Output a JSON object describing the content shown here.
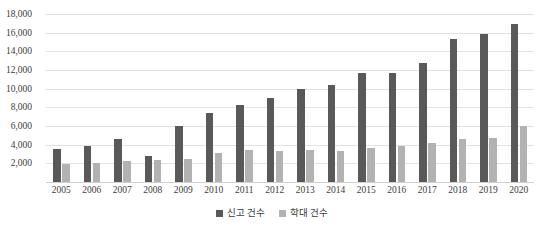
{
  "chart_data": {
    "type": "bar",
    "title": "",
    "xlabel": "",
    "ylabel": "",
    "ylim": [
      0,
      18000
    ],
    "ytick_step": 2000,
    "grid": true,
    "legend_position": "bottom",
    "categories": [
      "2005",
      "2006",
      "2007",
      "2008",
      "2009",
      "2010",
      "2011",
      "2012",
      "2013",
      "2014",
      "2015",
      "2016",
      "2017",
      "2018",
      "2019",
      "2020"
    ],
    "ytick_labels": [
      "18,000",
      "16,000",
      "14,000",
      "12,000",
      "10,000",
      "8,000",
      "6,000",
      "4,000",
      "2,000"
    ],
    "ytick_values": [
      18000,
      16000,
      14000,
      12000,
      10000,
      8000,
      6000,
      4000,
      2000
    ],
    "series": [
      {
        "name": "신고 건수",
        "color": "#595959",
        "values": [
          3500,
          3900,
          4600,
          2800,
          6000,
          7400,
          8300,
          9000,
          10000,
          10400,
          11700,
          11700,
          12800,
          15300,
          15900,
          16900
        ]
      },
      {
        "name": "학대 건수",
        "color": "#b2b2b2",
        "values": [
          1900,
          2000,
          2300,
          2400,
          2500,
          3100,
          3400,
          3300,
          3400,
          3300,
          3600,
          3900,
          4200,
          4600,
          4700,
          6000
        ]
      }
    ]
  },
  "legend": {
    "entries": [
      {
        "label": "신고 건수",
        "swatch": "legend-swatch-dark"
      },
      {
        "label": "학대 건수",
        "swatch": "legend-swatch-light"
      }
    ]
  }
}
